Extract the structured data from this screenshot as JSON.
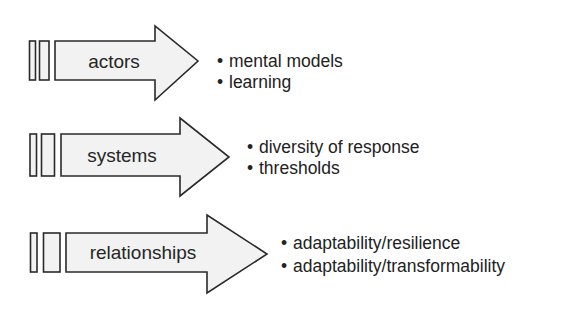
{
  "rows": [
    {
      "label": "actors",
      "bullets": [
        "mental models",
        "learning"
      ]
    },
    {
      "label": "systems",
      "bullets": [
        "diversity of response",
        "thresholds"
      ]
    },
    {
      "label": "relationships",
      "bullets": [
        "adaptability/resilience",
        "adaptability/transformability"
      ]
    }
  ],
  "colors": {
    "arrow_fill": "#f2f2f2",
    "stroke": "#2a2a2a",
    "text": "#222222"
  }
}
